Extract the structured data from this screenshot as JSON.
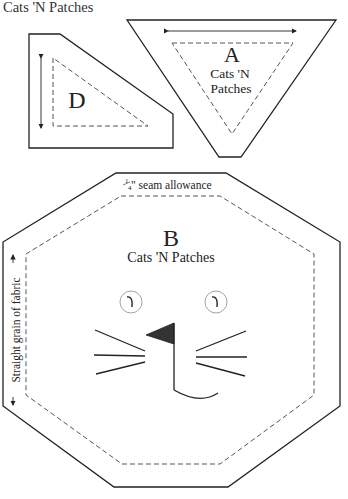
{
  "header": {
    "title": "Cats 'N Patches"
  },
  "pieces": {
    "a": {
      "letter": "A",
      "label_line1": "Cats 'N",
      "label_line2": "Patches"
    },
    "d": {
      "letter": "D"
    },
    "b": {
      "letter": "B",
      "label": "Cats 'N Patches",
      "seam_fraction_num": "1",
      "seam_fraction_den": "4",
      "seam_label": "\" seam allowance",
      "grain_label": "Straight grain of fabric"
    }
  },
  "colors": {
    "line": "#222222",
    "dash": "#555555",
    "eye": "#999999"
  }
}
